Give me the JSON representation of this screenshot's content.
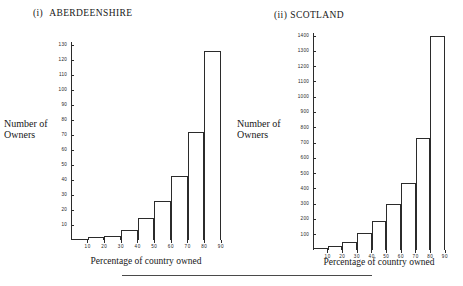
{
  "figure": {
    "footer_rule": true,
    "ink_color": "#2b2b2b",
    "background": "#ffffff"
  },
  "panels": [
    {
      "numeral": "(i)",
      "title": "ABERDEENSHIRE",
      "y_caption_line1": "Number of",
      "y_caption_line2": "Owners",
      "x_caption": "Percentage of country owned"
    },
    {
      "numeral": "(ii)",
      "title": "SCOTLAND",
      "y_caption_line1": "Number of",
      "y_caption_line2": "Owners",
      "x_caption": "Percentage of country owned"
    }
  ],
  "chart_data": [
    {
      "type": "bar",
      "title": "(i) ABERDEENSHIRE",
      "xlabel": "Percentage of country owned",
      "ylabel": "Number of Owners",
      "grid": false,
      "legend": null,
      "bin_edges": [
        0,
        10,
        20,
        30,
        40,
        50,
        60,
        70,
        80,
        90
      ],
      "categories": [
        "0-10",
        "10-20",
        "20-30",
        "30-40",
        "40-50",
        "50-60",
        "60-70",
        "70-80",
        "80-90"
      ],
      "values": [
        1,
        2,
        3,
        7,
        15,
        26,
        43,
        72,
        126
      ],
      "xlim": [
        0,
        90
      ],
      "ylim": [
        0,
        132
      ],
      "xticks": [
        10,
        20,
        30,
        40,
        50,
        60,
        70,
        80,
        90
      ],
      "xtick_labels": [
        "10",
        "20",
        "30",
        "40",
        "50",
        "60",
        "70",
        "80",
        "90"
      ],
      "yticks": [
        10,
        20,
        30,
        40,
        50,
        60,
        70,
        80,
        90,
        100,
        110,
        120,
        130
      ],
      "ytick_labels": [
        "10",
        "20",
        "30",
        "40",
        "50",
        "60",
        "70",
        "80",
        "90",
        "100",
        "110",
        "120",
        "130"
      ]
    },
    {
      "type": "bar",
      "title": "(ii) SCOTLAND",
      "xlabel": "Percentage of country owned",
      "ylabel": "Number of Owners",
      "grid": false,
      "legend": null,
      "bin_edges": [
        0,
        10,
        20,
        30,
        40,
        50,
        60,
        70,
        80,
        90
      ],
      "categories": [
        "0-10",
        "10-20",
        "20-30",
        "30-40",
        "40-50",
        "50-60",
        "60-70",
        "70-80",
        "80-90"
      ],
      "values": [
        10,
        25,
        50,
        110,
        190,
        300,
        440,
        730,
        1400
      ],
      "xlim": [
        0,
        90
      ],
      "ylim": [
        0,
        1420
      ],
      "xticks": [
        10,
        20,
        30,
        40,
        50,
        60,
        70,
        80,
        90
      ],
      "xtick_labels": [
        "10",
        "20",
        "30",
        "40",
        "50",
        "60",
        "70",
        "80",
        "90"
      ],
      "yticks": [
        100,
        200,
        300,
        400,
        500,
        600,
        700,
        800,
        900,
        1000,
        1100,
        1200,
        1300,
        1400
      ],
      "ytick_labels": [
        "100",
        "200",
        "300",
        "400",
        "500",
        "600",
        "700",
        "800",
        "900",
        "1000",
        "1100",
        "1200",
        "1300",
        "1400"
      ]
    }
  ]
}
